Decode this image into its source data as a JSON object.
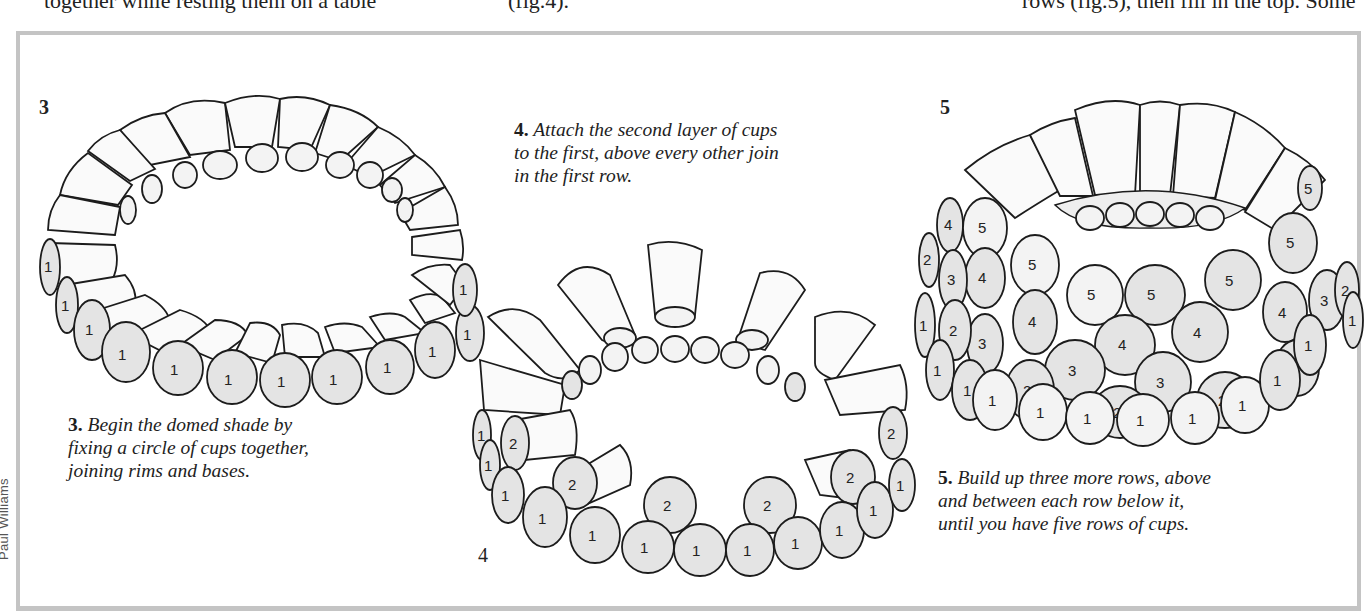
{
  "page": {
    "top_text_fragments": [
      {
        "text": "together while resting them on a table",
        "x": 14
      },
      {
        "text": "(fig.4).",
        "x": 508
      },
      {
        "text": "rows (fig.5), then fill in the top. Some",
        "x": 940
      }
    ],
    "illustrator_credit": "Paul Williams"
  },
  "figures": [
    {
      "id": "3",
      "label": "3",
      "caption_number": "3.",
      "caption": "Begin the domed shade by fixing a circle of cups together, joining rims and bases.",
      "caption_lines": [
        "Begin the domed shade by",
        "fixing a circle of cups together,",
        "joining rims and bases."
      ],
      "cup_labels": [
        "1",
        "1",
        "1",
        "1",
        "1",
        "1",
        "1",
        "1",
        "1",
        "1",
        "1",
        "1",
        "1"
      ]
    },
    {
      "id": "4",
      "label": "4",
      "caption_number": "4.",
      "caption": "Attach the second layer of cups to the first, above every other join in the first row.",
      "caption_lines": [
        "Attach the second layer of cups",
        "to the first, above every other join",
        "in the first row."
      ],
      "cup_labels_row1": [
        "1",
        "1",
        "1",
        "1",
        "1",
        "1",
        "1",
        "1",
        "1",
        "1",
        "1",
        "1",
        "1",
        "1"
      ],
      "cup_labels_row2": [
        "2",
        "2",
        "2",
        "2",
        "2",
        "2"
      ]
    },
    {
      "id": "5",
      "label": "5",
      "caption_number": "5.",
      "caption": "Build up three more rows, above and between each row below it, until you have five rows of cups.",
      "caption_lines": [
        "Build up three more rows, above",
        "and between each row below it,",
        "until you have five rows of cups."
      ],
      "cup_labels_rows": {
        "row1": [
          "1",
          "1",
          "1",
          "1",
          "1",
          "1",
          "1",
          "1",
          "1",
          "1",
          "1",
          "1"
        ],
        "row2": [
          "2",
          "2",
          "2",
          "2",
          "2",
          "2",
          "2"
        ],
        "row3": [
          "3",
          "3",
          "3",
          "3",
          "3"
        ],
        "row4": [
          "4",
          "4",
          "4",
          "4",
          "4",
          "4"
        ],
        "row5": [
          "5",
          "5",
          "5",
          "5",
          "5",
          "5",
          "5"
        ]
      }
    }
  ],
  "colors": {
    "frame": "#c4c4c4",
    "ink": "#1c1c1c",
    "shade": "#e4e4e4"
  }
}
